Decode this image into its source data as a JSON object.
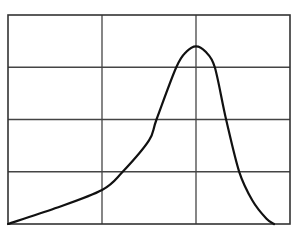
{
  "chart_data": {
    "type": "line",
    "title": "",
    "xlabel": "",
    "ylabel": "",
    "xlim": [
      0,
      3
    ],
    "ylim": [
      0,
      4
    ],
    "grid": true,
    "grid_columns": 3,
    "grid_rows": 4,
    "legend": null,
    "series": [
      {
        "name": "curve",
        "color": "#111111",
        "points": [
          [
            0.0,
            0.0
          ],
          [
            0.5,
            0.3
          ],
          [
            1.0,
            0.65
          ],
          [
            1.22,
            1.0
          ],
          [
            1.5,
            1.6
          ],
          [
            1.58,
            2.0
          ],
          [
            1.79,
            3.0
          ],
          [
            1.9,
            3.3
          ],
          [
            2.0,
            3.4
          ],
          [
            2.1,
            3.3
          ],
          [
            2.2,
            3.0
          ],
          [
            2.32,
            2.0
          ],
          [
            2.46,
            1.0
          ],
          [
            2.6,
            0.45
          ],
          [
            2.75,
            0.1
          ],
          [
            2.83,
            0.0
          ]
        ]
      }
    ]
  },
  "colors": {
    "frame": "#333333",
    "grid": "#444444",
    "line": "#111111",
    "background": "#ffffff"
  }
}
